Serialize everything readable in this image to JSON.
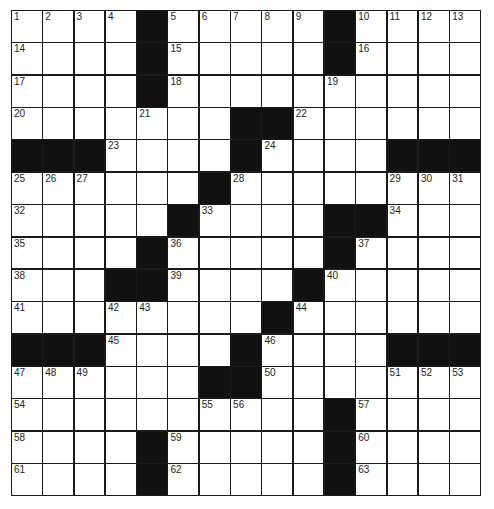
{
  "puzzle": {
    "size": {
      "rows": 15,
      "cols": 15
    },
    "colors": {
      "block": "#111111",
      "cell": "#ffffff",
      "line": "#1a1a1a"
    },
    "layout": [
      "....#.....#....",
      "....#.....#....",
      "....#..........",
      ".......##......",
      "###....#....###",
      "......#........",
      ".....#....##...",
      "....#.....#....",
      "...##...#.....",
      "........#......",
      "###....#....###",
      "......##.......",
      "..........#....",
      "....#.....#....",
      "....#.....#...."
    ],
    "numbers": [
      [
        1,
        2,
        3,
        4,
        0,
        5,
        6,
        7,
        8,
        9,
        0,
        10,
        11,
        12,
        13
      ],
      [
        14,
        0,
        0,
        0,
        0,
        15,
        0,
        0,
        0,
        0,
        0,
        16,
        0,
        0,
        0
      ],
      [
        17,
        0,
        0,
        0,
        0,
        18,
        0,
        0,
        0,
        0,
        19,
        0,
        0,
        0,
        0
      ],
      [
        20,
        0,
        0,
        0,
        21,
        0,
        0,
        0,
        0,
        22,
        0,
        0,
        0,
        0,
        0
      ],
      [
        0,
        0,
        0,
        23,
        0,
        0,
        0,
        0,
        24,
        0,
        0,
        0,
        0,
        0,
        0
      ],
      [
        25,
        26,
        27,
        0,
        0,
        0,
        0,
        28,
        0,
        0,
        0,
        0,
        29,
        30,
        31
      ],
      [
        32,
        0,
        0,
        0,
        0,
        0,
        33,
        0,
        0,
        0,
        0,
        0,
        34,
        0,
        0
      ],
      [
        35,
        0,
        0,
        0,
        0,
        36,
        0,
        0,
        0,
        0,
        0,
        37,
        0,
        0,
        0
      ],
      [
        38,
        0,
        0,
        0,
        0,
        39,
        0,
        0,
        0,
        0,
        40,
        0,
        0,
        0,
        0
      ],
      [
        41,
        0,
        0,
        42,
        43,
        0,
        0,
        0,
        0,
        44,
        0,
        0,
        0,
        0,
        0
      ],
      [
        0,
        0,
        0,
        45,
        0,
        0,
        0,
        0,
        46,
        0,
        0,
        0,
        0,
        0,
        0
      ],
      [
        47,
        48,
        49,
        0,
        0,
        0,
        0,
        0,
        50,
        0,
        0,
        0,
        51,
        52,
        53
      ],
      [
        54,
        0,
        0,
        0,
        0,
        0,
        55,
        56,
        0,
        0,
        0,
        57,
        0,
        0,
        0
      ],
      [
        58,
        0,
        0,
        0,
        0,
        59,
        0,
        0,
        0,
        0,
        0,
        60,
        0,
        0,
        0
      ],
      [
        61,
        0,
        0,
        0,
        0,
        62,
        0,
        0,
        0,
        0,
        0,
        63,
        0,
        0,
        0
      ]
    ],
    "entries": []
  }
}
